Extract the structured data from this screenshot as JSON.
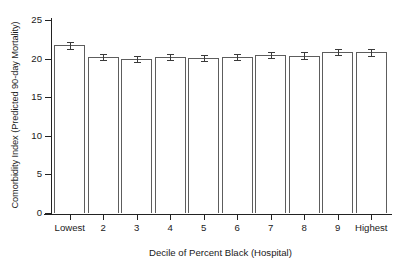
{
  "chart_data": {
    "type": "bar",
    "title": "",
    "xlabel": "Decile of Percent Black (Hospital)",
    "ylabel": "Comorbidity Index (Predicted 90-day Mortality)",
    "categories": [
      "Lowest",
      "2",
      "3",
      "4",
      "5",
      "6",
      "7",
      "8",
      "9",
      "Highest"
    ],
    "values": [
      21.7,
      20.2,
      20.0,
      20.2,
      20.1,
      20.2,
      20.5,
      20.4,
      20.9,
      20.8
    ],
    "error_low": [
      21.2,
      19.8,
      19.6,
      19.8,
      19.7,
      19.8,
      20.1,
      20.0,
      20.5,
      20.4
    ],
    "error_high": [
      22.2,
      20.6,
      20.4,
      20.6,
      20.5,
      20.6,
      20.9,
      20.8,
      21.3,
      21.2
    ],
    "ylim": [
      0,
      25
    ],
    "yticks": [
      0,
      5,
      10,
      15,
      20,
      25
    ],
    "ytick_labels": [
      "0",
      "5",
      "10",
      "15",
      "20",
      "25"
    ],
    "grid": false,
    "legend": null,
    "bar_fill_color": "#ffffff",
    "bar_edge_color": "#5d5d5d",
    "error_bar_color": "#3a3a3a",
    "axis_color": "#222222",
    "background_color": "#ffffff"
  }
}
